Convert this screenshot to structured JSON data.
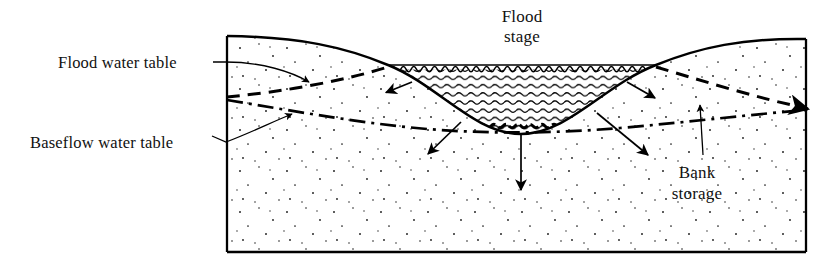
{
  "figure": {
    "name": "stream-bank-storage-cross-section",
    "background_color": "#ffffff",
    "line_color": "#000000"
  },
  "labels": {
    "flood_water_table": "Flood water table",
    "baseflow_water_table": "Baseflow water table",
    "flood_stage_line1": "Flood",
    "flood_stage_line2": "stage",
    "bank_storage_line1": "Bank",
    "bank_storage_line2": "storage"
  },
  "elements": {
    "ground_surface": "ground-surface-profile",
    "box_frame": "aquifer-box-frame",
    "water_body": "flood-water-in-channel",
    "water_surface": "flood-stage-water-surface",
    "flood_water_table_line": "dashed-flood-water-table",
    "baseflow_water_table_line": "dash-dot-baseflow-water-table",
    "aquifer_stipple": "sand-aquifer-stipple-texture"
  },
  "arrows": [
    {
      "name": "arrow-left-bank-into-bank",
      "from": [
        412,
        82
      ],
      "to": [
        384,
        93
      ]
    },
    {
      "name": "arrow-right-bank-into-bank",
      "from": [
        627,
        82
      ],
      "to": [
        657,
        99
      ]
    },
    {
      "name": "arrow-left-bed-downleft",
      "from": [
        461,
        122
      ],
      "to": [
        426,
        156
      ]
    },
    {
      "name": "arrow-bed-vertical-down",
      "from": [
        521,
        133
      ],
      "to": [
        521,
        192
      ]
    },
    {
      "name": "arrow-right-bed-downright",
      "from": [
        597,
        113
      ],
      "to": [
        650,
        157
      ]
    }
  ],
  "leaders": [
    {
      "name": "leader-flood-water-table",
      "from": [
        224,
        63
      ],
      "to": [
        311,
        83
      ]
    },
    {
      "name": "leader-baseflow-water-table",
      "from": [
        227,
        141
      ],
      "to": [
        294,
        113
      ]
    },
    {
      "name": "leader-bank-storage",
      "from": [
        703,
        155
      ],
      "to": [
        700,
        103
      ]
    }
  ],
  "geometry": {
    "box_left": 227,
    "box_right": 806,
    "box_top": 36,
    "box_bottom": 252,
    "water_surface_y": 65,
    "water_left_x": 388,
    "water_right_x": 656,
    "channel_bottom_y": 134
  }
}
